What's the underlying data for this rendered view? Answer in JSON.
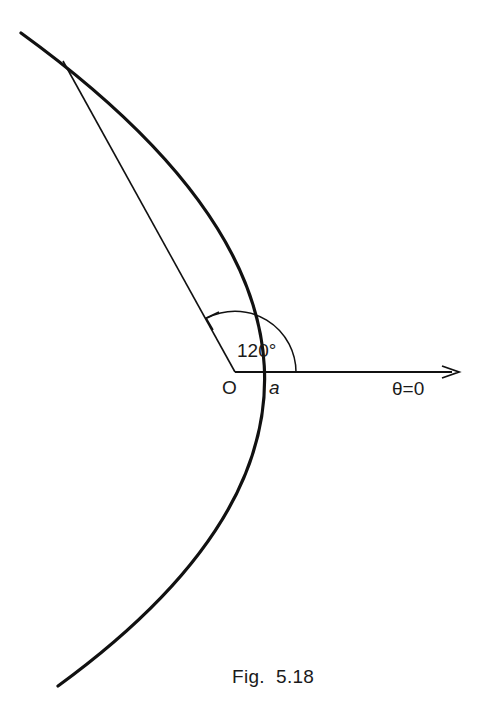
{
  "figure": {
    "caption": "Fig.  5.18",
    "curve": "parabola",
    "labels": {
      "angle": "120°",
      "origin": "O",
      "distance": "a",
      "axis": "θ=0"
    }
  },
  "geometry": {
    "origin": [
      235,
      372
    ],
    "vertex": [
      321,
      372
    ],
    "axis_end": [
      458,
      372
    ],
    "radius_end": [
      63,
      61
    ],
    "arc_radius": 61,
    "angle_degrees": 120
  }
}
